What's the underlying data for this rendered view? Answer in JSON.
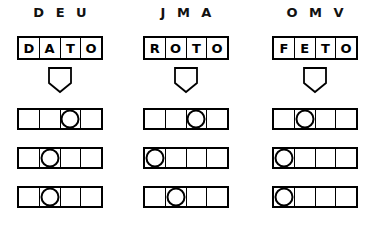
{
  "page": {
    "background_color": "#ffffff",
    "ink_color": "#000000",
    "cells_per_row": 4
  },
  "columns": [
    {
      "header": "D E U",
      "initials": [
        "D",
        "E",
        "U"
      ],
      "word": "DATO",
      "word_letters": [
        "D",
        "A",
        "T",
        "O"
      ],
      "arrow": "down-arrow-pentagon",
      "rows": [
        {
          "marked_index": 2,
          "cells": [
            "",
            "",
            "circle",
            ""
          ]
        },
        {
          "marked_index": 1,
          "cells": [
            "",
            "circle",
            "",
            ""
          ]
        },
        {
          "marked_index": 1,
          "cells": [
            "",
            "circle",
            "",
            ""
          ]
        }
      ]
    },
    {
      "header": "J M A",
      "initials": [
        "J",
        "M",
        "A"
      ],
      "word": "ROTO",
      "word_letters": [
        "R",
        "O",
        "T",
        "O"
      ],
      "arrow": "down-arrow-pentagon",
      "rows": [
        {
          "marked_index": 2,
          "cells": [
            "",
            "",
            "circle",
            ""
          ]
        },
        {
          "marked_index": 0,
          "cells": [
            "circle",
            "",
            "",
            ""
          ]
        },
        {
          "marked_index": 1,
          "cells": [
            "",
            "circle",
            "",
            ""
          ]
        }
      ]
    },
    {
      "header": "O M V",
      "initials": [
        "O",
        "M",
        "V"
      ],
      "word": "FETO",
      "word_letters": [
        "F",
        "E",
        "T",
        "O"
      ],
      "arrow": "down-arrow-pentagon",
      "rows": [
        {
          "marked_index": 1,
          "cells": [
            "",
            "circle",
            "",
            ""
          ]
        },
        {
          "marked_index": 0,
          "cells": [
            "circle",
            "",
            "",
            ""
          ]
        },
        {
          "marked_index": 0,
          "cells": [
            "circle",
            "",
            "",
            ""
          ]
        }
      ]
    }
  ],
  "layout": {
    "column_left_positions": [
      17,
      143,
      272
    ]
  }
}
